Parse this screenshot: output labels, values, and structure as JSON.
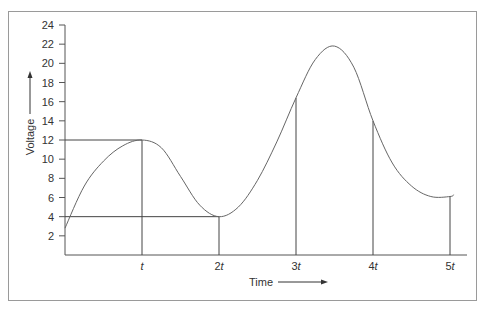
{
  "chart_data": {
    "type": "line",
    "title": "",
    "xlabel": "Time",
    "ylabel": "Voltage",
    "x_tick_labels": [
      {
        "base": "",
        "var": "t"
      },
      {
        "base": "2",
        "var": "t"
      },
      {
        "base": "3",
        "var": "t"
      },
      {
        "base": "4",
        "var": "t"
      },
      {
        "base": "5",
        "var": "t"
      }
    ],
    "y_ticks": [
      2,
      4,
      6,
      8,
      10,
      12,
      14,
      16,
      18,
      20,
      22,
      24
    ],
    "ylim": [
      0,
      24
    ],
    "xlim": [
      0,
      5.2
    ],
    "grid": false,
    "legend": null,
    "series": [
      {
        "name": "Voltage",
        "x": [
          0,
          0.25,
          0.5,
          0.75,
          1.0,
          1.25,
          1.5,
          1.75,
          2.0,
          2.25,
          2.5,
          2.75,
          3.0,
          3.25,
          3.5,
          3.75,
          4.0,
          4.25,
          4.5,
          4.75,
          5.0,
          5.05
        ],
        "values": [
          2.8,
          7.2,
          9.8,
          11.4,
          12.0,
          11.2,
          8.2,
          5.2,
          4.0,
          5.0,
          7.8,
          11.8,
          16.4,
          20.4,
          21.8,
          19.6,
          14.0,
          9.6,
          7.2,
          6.1,
          6.1,
          6.3
        ]
      }
    ],
    "annotations": [
      {
        "type": "vline",
        "x": 1,
        "y_top": 12,
        "label": "t"
      },
      {
        "type": "vline",
        "x": 2,
        "y_top": 4,
        "label": "2t"
      },
      {
        "type": "vline",
        "x": 3,
        "y_top": 16.4,
        "label": "3t"
      },
      {
        "type": "vline",
        "x": 4,
        "y_top": 14,
        "label": "4t"
      },
      {
        "type": "vline",
        "x": 5,
        "y_top": 6.1,
        "label": "5t"
      },
      {
        "type": "hline",
        "y": 12,
        "x_end": 1
      },
      {
        "type": "hline",
        "y": 4,
        "x_end": 2
      }
    ],
    "axis_arrows": {
      "x": "right-arrow-after-label",
      "y": "up-arrow-after-label"
    }
  }
}
